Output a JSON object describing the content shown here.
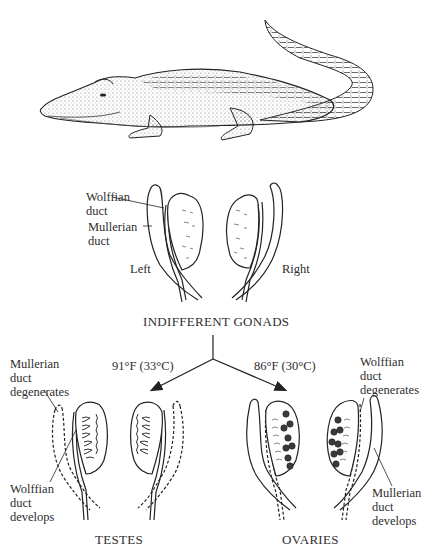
{
  "figure": {
    "section_titles": {
      "indifferent": "INDIFFERENT GONADS",
      "testes": "TESTES",
      "ovaries": "OVARIES"
    },
    "indifferent_labels": {
      "wolffian": "Wolffian\nduct",
      "mullerian": "Mullerian\nduct",
      "left": "Left",
      "right": "Right"
    },
    "temperatures": {
      "male": "91°F (33°C)",
      "female": "86°F (30°C)"
    },
    "testes_labels": {
      "mullerian_degenerates": "Mullerian\nduct\ndegenerates",
      "wolffian_develops": "Wolffian\nduct\ndevelops"
    },
    "ovaries_labels": {
      "wolffian_degenerates": "Wolffian\nduct\ndegenerates",
      "mullerian_develops": "Mullerian\nduct\ndevelops"
    }
  }
}
